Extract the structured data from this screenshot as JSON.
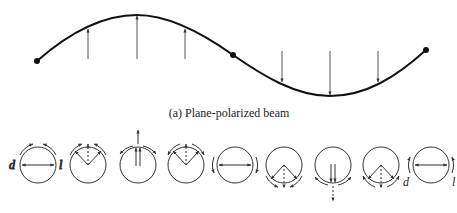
{
  "figure": {
    "caption": "(a) Plane-polarized beam",
    "wave": {
      "description": "sinusoidal plane-polarized wave with vertical field vectors",
      "points": {
        "start": [
          37,
          61
        ],
        "middle": [
          233,
          55
        ],
        "end": [
          426,
          50
        ]
      },
      "up_arrows_x": [
        88,
        137,
        185
      ],
      "down_arrows_x": [
        282,
        330,
        378
      ]
    },
    "circles": [
      {
        "index": 1,
        "vector": "horizontal",
        "left_label": "d",
        "right_label": "l",
        "rotation_arrows": "top"
      },
      {
        "index": 2,
        "vector": "diagonal-up",
        "rotation_arrows": "top"
      },
      {
        "index": 3,
        "vector": "vertical-up",
        "rotation_arrows": "top"
      },
      {
        "index": 4,
        "vector": "diagonal-up",
        "rotation_arrows": "top"
      },
      {
        "index": 5,
        "vector": "horizontal",
        "rotation_arrows": "sides"
      },
      {
        "index": 6,
        "vector": "diagonal-down",
        "rotation_arrows": "bottom"
      },
      {
        "index": 7,
        "vector": "vertical-down",
        "rotation_arrows": "bottom"
      },
      {
        "index": 8,
        "vector": "diagonal-down",
        "rotation_arrows": "bottom"
      },
      {
        "index": 9,
        "vector": "horizontal",
        "left_label": "d",
        "right_label": "l",
        "rotation_arrows": "sides"
      }
    ],
    "labels": {
      "d": "d",
      "l": "l"
    },
    "colors": {
      "stroke": "#1a1a1a",
      "thin": "#555555"
    }
  }
}
